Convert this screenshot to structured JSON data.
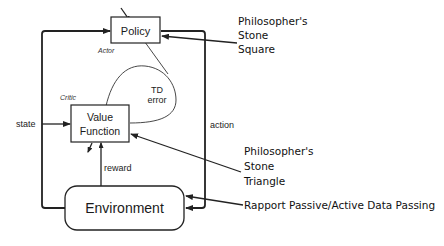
{
  "diagram": {
    "type": "actor-critic reinforcement learning block diagram",
    "nodes": {
      "policy": {
        "label": "Policy",
        "role_label": "Actor"
      },
      "value_function": {
        "label_line1": "Value",
        "label_line2": "Function",
        "role_label": "Critic"
      },
      "environment": {
        "label": "Environment"
      }
    },
    "edges": {
      "state": "state",
      "action": "action",
      "reward": "reward",
      "td_error_line1": "TD",
      "td_error_line2": "error"
    },
    "annotations": {
      "square": {
        "line1": "Philosopher's",
        "line2": "Stone",
        "line3": "Square"
      },
      "triangle": {
        "line1": "Philosopher's",
        "line2": "Stone",
        "line3": "Triangle"
      },
      "rapport": "Rapport Passive/Active Data Passing"
    },
    "colors": {
      "stroke": "#222222",
      "background": "#ffffff",
      "text": "#111111"
    }
  }
}
